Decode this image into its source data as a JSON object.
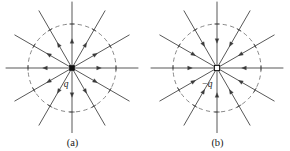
{
  "figure": {
    "background_color": "#ffffff",
    "line_color": "#3a3a3a",
    "dashed_color": "#7a7a7a",
    "width": 290,
    "height": 151
  },
  "panels": [
    {
      "id": "a",
      "caption": "(a)",
      "charge_label": "q",
      "charge_sign": "positive",
      "charge_marker": "filled-square",
      "field_direction": "outward",
      "center_x": 72,
      "center_y": 68,
      "ray_count": 12,
      "ray_angle_step_deg": 30,
      "ray_length": 66,
      "dashed_circle_radius": 44,
      "arrow_radius": 27,
      "tick_radius": 44,
      "charge_label_dx": -6,
      "charge_label_dy": 19
    },
    {
      "id": "b",
      "caption": "(b)",
      "charge_label": "−q",
      "charge_sign": "negative",
      "charge_marker": "open-square",
      "field_direction": "inward",
      "center_x": 72,
      "center_y": 68,
      "ray_count": 12,
      "ray_angle_step_deg": 30,
      "ray_length": 66,
      "dashed_circle_radius": 44,
      "arrow_radius": 27,
      "tick_radius": 44,
      "charge_label_dx": -10,
      "charge_label_dy": 19
    }
  ],
  "chart_data": {
    "type": "diagram",
    "subtitle": "",
    "xlabel": "",
    "ylabel": "",
    "legend": [],
    "annotations": [
      "q",
      "−q",
      "(a)",
      "(b)"
    ],
    "series": [
      {
        "name": "(a) positive point charge q",
        "charge": "+q",
        "field_line_count": 12,
        "field_line_angles_deg": [
          0,
          30,
          60,
          90,
          120,
          150,
          180,
          210,
          240,
          270,
          300,
          330
        ],
        "arrow_direction": "radially outward",
        "equipotential_circles": 1,
        "equipotential_radius_px": 44
      },
      {
        "name": "(b) negative point charge -q",
        "charge": "-q",
        "field_line_count": 12,
        "field_line_angles_deg": [
          0,
          30,
          60,
          90,
          120,
          150,
          180,
          210,
          240,
          270,
          300,
          330
        ],
        "arrow_direction": "radially inward",
        "equipotential_circles": 1,
        "equipotential_radius_px": 44
      }
    ]
  }
}
